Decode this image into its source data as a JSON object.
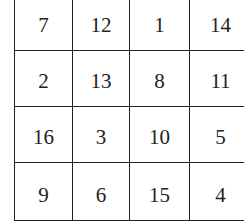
{
  "magic_square": {
    "rows": [
      [
        "7",
        "12",
        "1",
        "14"
      ],
      [
        "2",
        "13",
        "8",
        "11"
      ],
      [
        "16",
        "3",
        "10",
        "5"
      ],
      [
        "9",
        "6",
        "15",
        "4"
      ]
    ]
  }
}
